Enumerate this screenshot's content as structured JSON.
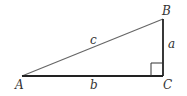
{
  "diagram": {
    "type": "right-triangle",
    "vertices": {
      "A": {
        "label": "A",
        "x": 22,
        "y": 76
      },
      "B": {
        "label": "B",
        "x": 163,
        "y": 19
      },
      "C": {
        "label": "C",
        "x": 163,
        "y": 76
      }
    },
    "sides": {
      "a": {
        "label": "a",
        "from": "B",
        "to": "C"
      },
      "b": {
        "label": "b",
        "from": "A",
        "to": "C"
      },
      "c": {
        "label": "c",
        "from": "A",
        "to": "B"
      }
    },
    "right_angle_at": "C",
    "colors": {
      "stroke_hypotenuse": "#555555",
      "stroke_legs": "#222222",
      "label": "#333333"
    }
  }
}
